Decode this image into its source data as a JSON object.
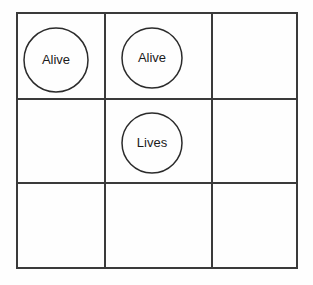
{
  "diagram": {
    "type": "grid-with-circle-tokens",
    "background_color": "#fefefe",
    "line_color": "#3a3a3a",
    "circle_stroke_color": "#2b2b2b",
    "text_color": "#1b1b1b",
    "grid": {
      "rows": 3,
      "columns": 3,
      "left": 17,
      "top": 13,
      "right": 297,
      "bottom": 268,
      "column_edges": [
        17,
        105,
        212,
        297
      ],
      "row_edges": [
        13,
        99,
        183,
        268
      ]
    },
    "cells": [
      {
        "row": 0,
        "col": 0,
        "label": "Alive",
        "has_circle": true,
        "cx": 56,
        "cy": 60,
        "r": 32
      },
      {
        "row": 0,
        "col": 1,
        "label": "Alive",
        "has_circle": true,
        "cx": 152,
        "cy": 58,
        "r": 30
      },
      {
        "row": 0,
        "col": 2,
        "label": "",
        "has_circle": false,
        "cx": 255,
        "cy": 56,
        "r": 0
      },
      {
        "row": 1,
        "col": 0,
        "label": "",
        "has_circle": false,
        "cx": 61,
        "cy": 141,
        "r": 0
      },
      {
        "row": 1,
        "col": 1,
        "label": "Lives",
        "has_circle": true,
        "cx": 152,
        "cy": 143,
        "r": 30
      },
      {
        "row": 1,
        "col": 2,
        "label": "",
        "has_circle": false,
        "cx": 255,
        "cy": 141,
        "r": 0
      },
      {
        "row": 2,
        "col": 0,
        "label": "",
        "has_circle": false,
        "cx": 61,
        "cy": 225,
        "r": 0
      },
      {
        "row": 2,
        "col": 1,
        "label": "",
        "has_circle": false,
        "cx": 158,
        "cy": 225,
        "r": 0
      },
      {
        "row": 2,
        "col": 2,
        "label": "",
        "has_circle": false,
        "cx": 255,
        "cy": 225,
        "r": 0
      }
    ]
  }
}
